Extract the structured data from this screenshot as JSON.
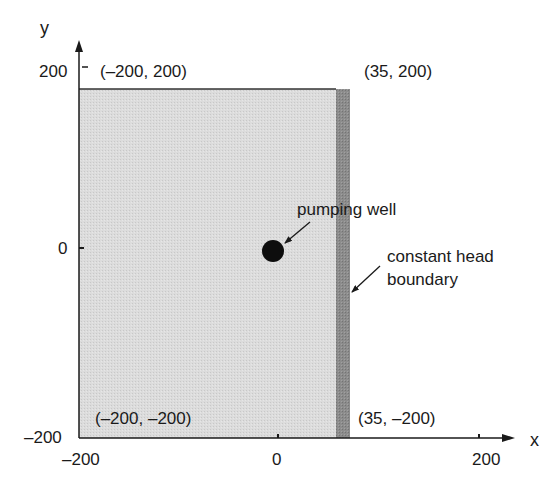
{
  "axes": {
    "x_label": "x",
    "y_label": "y",
    "x_ticks": [
      "-200",
      "0",
      "200"
    ],
    "y_ticks": [
      "200",
      "0",
      "-200"
    ],
    "x_tick_labels": {
      "neg200": "–200",
      "zero": "0",
      "pos200": "200"
    },
    "y_tick_labels": {
      "pos200": "200",
      "zero": "0",
      "neg200": "–200"
    }
  },
  "domain": {
    "fill_color": "#d9d9d9",
    "boundary_color": "#8a8a8a",
    "corners": {
      "top_left": "(–200, 200)",
      "top_right": "(35, 200)",
      "bottom_left": "(–200, –200)",
      "bottom_right": "(35, –200)"
    }
  },
  "annotations": {
    "well": "pumping well",
    "boundary_line1": "constant head",
    "boundary_line2": "boundary"
  }
}
